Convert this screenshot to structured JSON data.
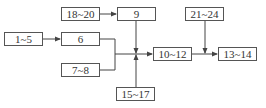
{
  "diagram": {
    "type": "flow",
    "nodes": [
      {
        "id": "n1",
        "label": "1~5"
      },
      {
        "id": "n2",
        "label": "6"
      },
      {
        "id": "n3",
        "label": "18~20"
      },
      {
        "id": "n4",
        "label": "9"
      },
      {
        "id": "n5",
        "label": "7~8"
      },
      {
        "id": "n6",
        "label": "15~17"
      },
      {
        "id": "n7",
        "label": "10~12"
      },
      {
        "id": "n8",
        "label": "21~24"
      },
      {
        "id": "n9",
        "label": "13~14"
      }
    ],
    "edges": [
      {
        "from": "1~5",
        "to": "6"
      },
      {
        "from": "18~20",
        "to": "9"
      },
      {
        "from": "6",
        "to": "10~12"
      },
      {
        "from": "7~8",
        "to": "10~12"
      },
      {
        "from": "9",
        "to": "10~12"
      },
      {
        "from": "15~17",
        "to": "10~12"
      },
      {
        "from": "10~12",
        "to": "13~14"
      },
      {
        "from": "21~24",
        "to": "13~14"
      }
    ],
    "colors": {
      "line": "#444444",
      "box_border": "#555555",
      "text": "#333333",
      "background": "#ffffff"
    }
  }
}
